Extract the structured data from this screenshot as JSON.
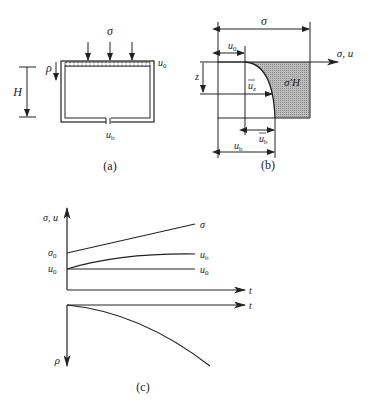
{
  "panel_a": {
    "caption": "(a)",
    "load_label": "σ",
    "top_pressure_label": "u",
    "top_pressure_sub": "0",
    "bottom_pressure_label": "u",
    "bottom_pressure_sub": "b",
    "settlement_label": "ρ",
    "height_label": "H"
  },
  "panel_b": {
    "caption": "(b)",
    "total_stress_label": "σ",
    "top_pressure_label": "u",
    "top_pressure_sub": "0",
    "axis_label": "σ, u",
    "depth_label": "z",
    "excess_z_label": "u",
    "excess_z_sub": "z",
    "effective_label": "σ′H",
    "excess_b_label": "u",
    "excess_b_sub": "b",
    "bottom_pressure_label": "u",
    "bottom_pressure_sub": "b"
  },
  "panel_c": {
    "caption": "(c)",
    "y_axis_label": "σ, u",
    "x_axis_label": "t",
    "x_axis_label_lower": "t",
    "lower_axis_label": "ρ",
    "sigma0_label": "σ",
    "sigma0_sub": "0",
    "u0_left_label": "u",
    "u0_left_sub": "0",
    "sigma_curve_label": "σ",
    "ub_curve_label": "u",
    "ub_curve_sub": "b",
    "u0_curve_label": "u",
    "u0_curve_sub": "0"
  }
}
